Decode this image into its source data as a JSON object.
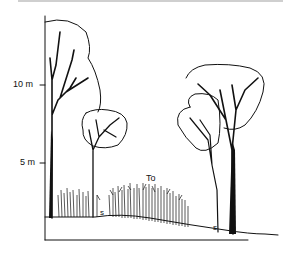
{
  "diagram": {
    "type": "forest vertical profile",
    "axis": {
      "ticks": [
        {
          "label": "10 m",
          "y": 85
        },
        {
          "label": "5 m",
          "y": 163
        }
      ]
    },
    "labels": {
      "tall_scrub": "To",
      "shrub_left": "s",
      "shrub_right": "s"
    },
    "colors": {
      "line": "#111111",
      "background": "#ffffff"
    }
  }
}
